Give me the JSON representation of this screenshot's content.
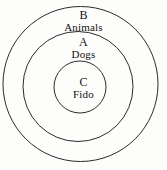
{
  "diagram": {
    "type": "nested-set-euler-diagram",
    "background_color": "#fdfdfc",
    "stroke_color": "#2b2b2b",
    "text_color": "#111111",
    "circles": [
      {
        "id": "outer",
        "letter": "B",
        "name": "Animals",
        "center_x": 80.5,
        "center_y": 84,
        "radius": 78
      },
      {
        "id": "middle",
        "letter": "A",
        "name": "Dogs",
        "center_x": 78,
        "center_y": 86,
        "radius": 55
      },
      {
        "id": "inner",
        "letter": "C",
        "name": "Fido",
        "center_x": 80,
        "center_y": 87,
        "radius": 26
      }
    ]
  }
}
